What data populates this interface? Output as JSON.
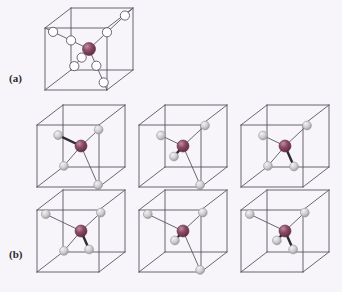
{
  "figure": {
    "background_color": "#f8f5fa",
    "panel_labels": [
      {
        "id": "a",
        "text": "(a)"
      },
      {
        "id": "b",
        "text": "(b)"
      }
    ],
    "caption_partial": "",
    "colors": {
      "cube_edge": "#5a5560",
      "bond_dark": "#2f2a33",
      "central_atom_fill": "#8c4a63",
      "central_atom_dark": "#5e2b40",
      "central_atom_highlight": "#c08ea1",
      "open_atom_fill": "#ffffff",
      "open_atom_stroke": "#5a5560",
      "gray_atom_fill": "#cfcfcf",
      "gray_atom_highlight": "#f2f2f2",
      "gray_atom_stroke": "#8d8d92"
    },
    "geometry": {
      "cube_front_x": 12,
      "cube_front_y": 22,
      "cube_side": 62,
      "cube_depth_x": 26,
      "cube_depth_y": -20
    }
  },
  "panels": [
    {
      "id": "panel-a",
      "label": "(a)",
      "rows": 1,
      "cubes": [
        {
          "id": "cube-a-1",
          "x": 33,
          "y": 6,
          "width": 106,
          "height": 96,
          "center_atom": {
            "type": "central",
            "frac": [
              0.5,
              0.5,
              0.5
            ],
            "radius": 6.5
          },
          "bonds": [
            {
              "dir": [
                1,
                1,
                1
              ],
              "atoms_on_bond": 2,
              "atom_type": "open",
              "atom_radius": 4.6
            },
            {
              "dir": [
                -1,
                -1,
                1
              ],
              "atoms_on_bond": 2,
              "atom_type": "open",
              "atom_radius": 4.6
            },
            {
              "dir": [
                1,
                -1,
                -1
              ],
              "atoms_on_bond": 2,
              "atom_type": "open",
              "atom_radius": 4.6
            },
            {
              "dir": [
                -1,
                1,
                -1
              ],
              "atoms_on_bond": 2,
              "atom_type": "open",
              "atom_radius": 4.6
            }
          ]
        }
      ]
    },
    {
      "id": "panel-b",
      "label": "(b)",
      "rows": 2,
      "cubes": [
        {
          "id": "cube-b-1",
          "x": 25,
          "y": 103,
          "width": 106,
          "height": 92,
          "variant": "config-1",
          "center_atom": {
            "type": "central",
            "frac": [
              0.5,
              0.5,
              0.5
            ],
            "radius": 6.0
          },
          "bonds": [
            {
              "dir": [
                -1,
                1,
                -1
              ],
              "length": 0.52,
              "atom_type": "gray",
              "atom_radius": 4.4,
              "bond_style": "thick"
            },
            {
              "dir": [
                1,
                1,
                1
              ],
              "length": 0.4,
              "atom_type": "gray",
              "atom_radius": 4.4,
              "bond_style": "thin"
            },
            {
              "dir": [
                1,
                -1,
                -1
              ],
              "length": 0.95,
              "atom_type": "gray",
              "atom_radius": 4.4,
              "bond_style": "thin"
            },
            {
              "dir": [
                -1,
                -1,
                1
              ],
              "length": 0.95,
              "atom_type": "gray",
              "atom_radius": 4.4,
              "bond_style": "thin"
            }
          ]
        },
        {
          "id": "cube-b-2",
          "x": 127,
          "y": 103,
          "width": 106,
          "height": 92,
          "variant": "config-2",
          "center_atom": {
            "type": "central",
            "frac": [
              0.5,
              0.5,
              0.5
            ],
            "radius": 6.0
          },
          "bonds": [
            {
              "dir": [
                -1,
                1,
                -1
              ],
              "length": 0.5,
              "atom_type": "gray",
              "atom_radius": 4.4,
              "bond_style": "thin"
            },
            {
              "dir": [
                1,
                1,
                1
              ],
              "length": 0.5,
              "atom_type": "gray",
              "atom_radius": 4.4,
              "bond_style": "thin"
            },
            {
              "dir": [
                -1,
                -1,
                1
              ],
              "length": 0.5,
              "atom_type": "gray",
              "atom_radius": 4.4,
              "bond_style": "thick"
            },
            {
              "dir": [
                1,
                -1,
                -1
              ],
              "length": 0.95,
              "atom_type": "gray",
              "atom_radius": 4.4,
              "bond_style": "thin"
            }
          ]
        },
        {
          "id": "cube-b-3",
          "x": 229,
          "y": 103,
          "width": 106,
          "height": 92,
          "variant": "config-3",
          "center_atom": {
            "type": "central",
            "frac": [
              0.5,
              0.5,
              0.5
            ],
            "radius": 6.0
          },
          "bonds": [
            {
              "dir": [
                -1,
                1,
                -1
              ],
              "length": 0.5,
              "atom_type": "gray",
              "atom_radius": 4.4,
              "bond_style": "thin"
            },
            {
              "dir": [
                1,
                1,
                1
              ],
              "length": 0.5,
              "atom_type": "gray",
              "atom_radius": 4.4,
              "bond_style": "thin"
            },
            {
              "dir": [
                1,
                -1,
                -1
              ],
              "length": 0.5,
              "atom_type": "gray",
              "atom_radius": 4.4,
              "bond_style": "thick"
            },
            {
              "dir": [
                -1,
                -1,
                1
              ],
              "length": 0.95,
              "atom_type": "gray",
              "atom_radius": 4.4,
              "bond_style": "thin"
            }
          ]
        },
        {
          "id": "cube-b-4",
          "x": 25,
          "y": 188,
          "width": 106,
          "height": 92,
          "variant": "config-4",
          "center_atom": {
            "type": "central",
            "frac": [
              0.5,
              0.5,
              0.5
            ],
            "radius": 6.0
          },
          "bonds": [
            {
              "dir": [
                -1,
                1,
                -1
              ],
              "length": 0.8,
              "atom_type": "gray",
              "atom_radius": 4.4,
              "bond_style": "thin"
            },
            {
              "dir": [
                1,
                1,
                1
              ],
              "length": 0.45,
              "atom_type": "gray",
              "atom_radius": 4.4,
              "bond_style": "thin"
            },
            {
              "dir": [
                1,
                -1,
                -1
              ],
              "length": 0.45,
              "atom_type": "gray",
              "atom_radius": 4.4,
              "bond_style": "thick"
            },
            {
              "dir": [
                -1,
                -1,
                1
              ],
              "length": 0.95,
              "atom_type": "gray",
              "atom_radius": 4.4,
              "bond_style": "thin"
            }
          ]
        },
        {
          "id": "cube-b-5",
          "x": 127,
          "y": 188,
          "width": 106,
          "height": 92,
          "variant": "config-5",
          "center_atom": {
            "type": "central",
            "frac": [
              0.5,
              0.5,
              0.5
            ],
            "radius": 6.0
          },
          "bonds": [
            {
              "dir": [
                -1,
                1,
                -1
              ],
              "length": 0.8,
              "atom_type": "gray",
              "atom_radius": 4.4,
              "bond_style": "thin"
            },
            {
              "dir": [
                1,
                1,
                1
              ],
              "length": 0.45,
              "atom_type": "gray",
              "atom_radius": 4.4,
              "bond_style": "thin"
            },
            {
              "dir": [
                -1,
                -1,
                1
              ],
              "length": 0.45,
              "atom_type": "gray",
              "atom_radius": 4.4,
              "bond_style": "thick"
            },
            {
              "dir": [
                1,
                -1,
                -1
              ],
              "length": 0.95,
              "atom_type": "gray",
              "atom_radius": 4.4,
              "bond_style": "thin"
            }
          ]
        },
        {
          "id": "cube-b-6",
          "x": 229,
          "y": 188,
          "width": 106,
          "height": 92,
          "variant": "config-6",
          "center_atom": {
            "type": "central",
            "frac": [
              0.5,
              0.5,
              0.5
            ],
            "radius": 6.0
          },
          "bonds": [
            {
              "dir": [
                -1,
                1,
                -1
              ],
              "length": 0.8,
              "atom_type": "gray",
              "atom_radius": 4.4,
              "bond_style": "thin"
            },
            {
              "dir": [
                1,
                1,
                1
              ],
              "length": 0.45,
              "atom_type": "gray",
              "atom_radius": 4.4,
              "bond_style": "thin"
            },
            {
              "dir": [
                -1,
                -1,
                1
              ],
              "length": 0.45,
              "atom_type": "gray",
              "atom_radius": 4.4,
              "bond_style": "thick"
            },
            {
              "dir": [
                1,
                -1,
                -1
              ],
              "length": 0.45,
              "atom_type": "gray",
              "atom_radius": 4.4,
              "bond_style": "thick"
            }
          ]
        }
      ]
    }
  ]
}
